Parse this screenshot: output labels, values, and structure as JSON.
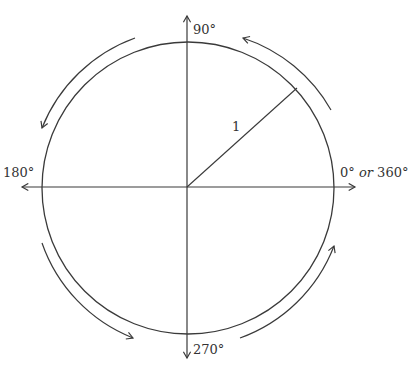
{
  "diagram": {
    "labels": {
      "top": "90°",
      "left": "180°",
      "bottom": "270°",
      "right_zero": "0°",
      "right_or": "or",
      "right_full": "360°",
      "radius": "1"
    },
    "colors": {
      "stroke": "#3a3a3a",
      "text": "#333333",
      "background": "#ffffff"
    }
  }
}
